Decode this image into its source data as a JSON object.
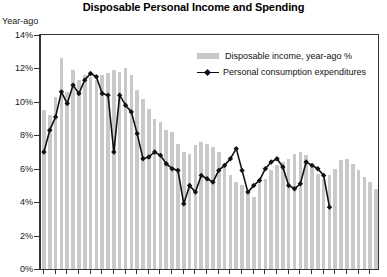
{
  "chart_data": {
    "type": "bar",
    "title": "Disposable Personal Income and Spending",
    "ylabel": "Year-ago",
    "xlabel": "",
    "ylim": [
      0,
      14
    ],
    "ytick_labels": [
      "0%",
      "2%",
      "4%",
      "6%",
      "8%",
      "10%",
      "12%",
      "14%"
    ],
    "ytick_values": [
      0,
      2,
      4,
      6,
      8,
      10,
      12,
      14
    ],
    "grid": false,
    "legend_position": "top-right",
    "legend": [
      "Disposable income, year-ago %",
      "Personal consumption expenditures"
    ],
    "series": [
      {
        "name": "Disposable income, year-ago %",
        "type": "bar",
        "color": "#c9c9c9",
        "values": [
          9.5,
          9.2,
          10.3,
          12.6,
          10.6,
          11.9,
          11.3,
          11.6,
          11.5,
          11.3,
          11.6,
          11.7,
          11.9,
          11.8,
          12.0,
          11.6,
          10.7,
          10.2,
          9.6,
          9.0,
          8.8,
          8.3,
          8.2,
          7.5,
          7.0,
          6.9,
          7.4,
          7.6,
          7.5,
          7.3,
          7.0,
          6.2,
          5.6,
          5.2,
          5.0,
          4.6,
          4.3,
          5.3,
          5.4,
          5.9,
          6.2,
          6.4,
          6.6,
          6.9,
          7.0,
          6.8,
          6.2,
          5.7,
          5.4,
          5.6,
          6.0,
          6.5,
          6.6,
          6.3,
          5.9,
          5.5,
          5.2,
          4.8
        ]
      },
      {
        "name": "Personal consumption expenditures",
        "type": "line",
        "color": "#111111",
        "marker": "diamond",
        "values": [
          7.0,
          8.3,
          9.1,
          10.6,
          9.9,
          11.0,
          10.5,
          11.3,
          11.7,
          11.5,
          10.5,
          10.4,
          7.0,
          10.4,
          9.8,
          9.4,
          8.1,
          6.6,
          6.7,
          7.0,
          6.8,
          6.3,
          6.0,
          5.9,
          3.9,
          5.0,
          4.6,
          5.6,
          5.4,
          5.2,
          5.9,
          6.2,
          6.6,
          7.2,
          5.9,
          4.6,
          5.0,
          5.3,
          6.0,
          6.4,
          6.6,
          6.1,
          5.0,
          4.8,
          5.1,
          6.4,
          6.2,
          6.0,
          5.6,
          3.7,
          0,
          0,
          0,
          0,
          0,
          0,
          0,
          0
        ]
      }
    ]
  }
}
